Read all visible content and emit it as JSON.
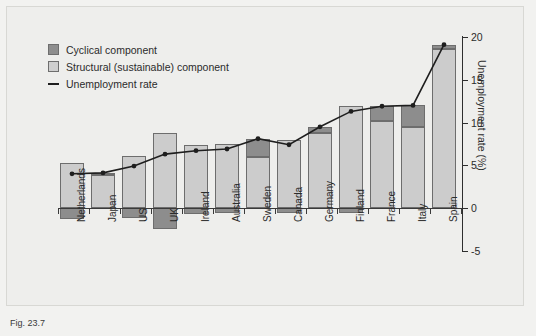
{
  "figure": {
    "caption": "Fig. 23.7"
  },
  "legend": {
    "position": "top-left",
    "items": [
      {
        "label": "Cyclical component",
        "marker": "square",
        "color": "#8e8e8e"
      },
      {
        "label": "Structural (sustainable) component",
        "marker": "square",
        "color": "#cfcfcf"
      },
      {
        "label": "Unemployment rate",
        "marker": "line",
        "color": "#1e1e1e"
      }
    ]
  },
  "axes": {
    "ylabel": "Unemployment rate (%)",
    "yticks": [
      "20",
      "15",
      "10",
      "5",
      "0",
      "-5"
    ],
    "ylim": [
      -5,
      20
    ],
    "grid": false
  },
  "chart_data": {
    "type": "bar",
    "title": "",
    "xlabel": "",
    "ylabel": "Unemployment rate (%)",
    "ylim": [
      -5,
      20
    ],
    "grid": false,
    "legend_position": "top-left",
    "categories": [
      "Netherlands",
      "Japan",
      "US",
      "UK",
      "Ireland",
      "Australia",
      "Sweden",
      "Canada",
      "Germany",
      "Finland",
      "France",
      "Italy",
      "Spain"
    ],
    "series": [
      {
        "name": "Structural (sustainable) component",
        "color": "#cccccc",
        "values": [
          5.3,
          3.9,
          6.1,
          8.8,
          7.4,
          7.5,
          6.0,
          8.0,
          8.8,
          11.9,
          10.2,
          9.5,
          18.6
        ]
      },
      {
        "name": "Cyclical component",
        "color": "#8d8d8d",
        "values": [
          -1.3,
          0.2,
          -1.2,
          -2.5,
          -0.7,
          -0.6,
          2.1,
          -0.6,
          0.7,
          -0.6,
          1.7,
          2.5,
          0.5
        ]
      },
      {
        "name": "Unemployment rate",
        "color": "#1e1e1e",
        "type": "line",
        "values": [
          4.0,
          4.1,
          4.9,
          6.3,
          6.7,
          6.9,
          8.1,
          7.4,
          9.5,
          11.3,
          11.9,
          12.0,
          19.1
        ]
      }
    ]
  }
}
